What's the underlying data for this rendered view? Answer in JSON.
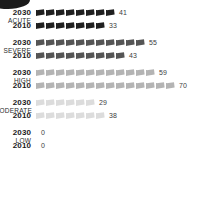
{
  "chart_data": {
    "type": "bar",
    "variant": "pictogram-isotype",
    "title": "",
    "subtitle": "",
    "xlabel": "",
    "ylabel": "",
    "legend_position": "none",
    "grid": false,
    "icon_glyph": "flag-icon",
    "icon_unit_note": "each icon represents approximately 5 units",
    "categories": [
      "ACUTE",
      "SEVERE",
      "HIGH",
      "MODERATE",
      "LOW"
    ],
    "series": [
      {
        "name": "2030",
        "values": [
          41,
          55,
          59,
          29,
          0
        ]
      },
      {
        "name": "2010",
        "values": [
          33,
          43,
          70,
          38,
          0
        ]
      }
    ],
    "groups": [
      {
        "label": "ACUTE",
        "label_wide": false,
        "color": "#1f1f1f",
        "rows": [
          {
            "year": "2030",
            "value": 41,
            "value_text": "41",
            "icons": 8
          },
          {
            "year": "2010",
            "value": 33,
            "value_text": "33",
            "icons": 7
          }
        ]
      },
      {
        "label": "SEVERE",
        "label_wide": false,
        "color": "#555555",
        "rows": [
          {
            "year": "2030",
            "value": 55,
            "value_text": "55",
            "icons": 11
          },
          {
            "year": "2010",
            "value": 43,
            "value_text": "43",
            "icons": 9
          }
        ]
      },
      {
        "label": "HIGH",
        "label_wide": false,
        "color": "#b4b4b4",
        "rows": [
          {
            "year": "2030",
            "value": 59,
            "value_text": "59",
            "icons": 12
          },
          {
            "year": "2010",
            "value": 70,
            "value_text": "70",
            "icons": 14
          }
        ]
      },
      {
        "label": "MODERATE",
        "label_wide": true,
        "color": "#dcdcdc",
        "rows": [
          {
            "year": "2030",
            "value": 29,
            "value_text": "29",
            "icons": 6
          },
          {
            "year": "2010",
            "value": 38,
            "value_text": "38",
            "icons": 7
          }
        ]
      },
      {
        "label": "LOW",
        "label_wide": false,
        "color": "#efefef",
        "rows": [
          {
            "year": "2030",
            "value": 0,
            "value_text": "0",
            "icons": 0
          },
          {
            "year": "2010",
            "value": 0,
            "value_text": "0",
            "icons": 0
          }
        ]
      }
    ]
  },
  "decoration": {
    "corner_blob_color": "#1b1b1b"
  }
}
